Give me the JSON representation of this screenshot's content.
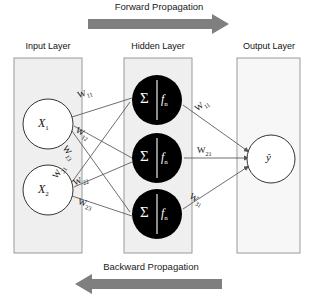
{
  "diagram": {
    "title_top": "Forward Propagation",
    "title_bottom": "Backward Propagation",
    "arrow_color": "#7f7f7f",
    "panel_color": "#efefef",
    "panel_border": "#9a9a9a",
    "node_stroke": "#333333",
    "hidden_node_fill": "#000000",
    "edge_color": "#555555"
  },
  "layers": {
    "input": {
      "label": "Input Layer"
    },
    "hidden": {
      "label": "Hidden Layer"
    },
    "output": {
      "label": "Output Layer"
    }
  },
  "nodes": {
    "input": [
      {
        "id": "x1",
        "label": "X",
        "sub": "1"
      },
      {
        "id": "x2",
        "label": "X",
        "sub": "2"
      }
    ],
    "hidden": [
      {
        "id": "h1",
        "sum_symbol": "Σ",
        "activation": "f",
        "activation_sub": "n"
      },
      {
        "id": "h2",
        "sum_symbol": "Σ",
        "activation": "f",
        "activation_sub": "n"
      },
      {
        "id": "h3",
        "sum_symbol": "Σ",
        "activation": "f",
        "activation_sub": "n"
      }
    ],
    "output": [
      {
        "id": "yhat",
        "label": "ŷ"
      }
    ]
  },
  "weights": {
    "input_to_hidden": [
      {
        "id": "w11",
        "label": "W",
        "sub": "11"
      },
      {
        "id": "w12",
        "label": "W",
        "sub": "12"
      },
      {
        "id": "w13",
        "label": "W",
        "sub": "13"
      },
      {
        "id": "w21",
        "label": "W",
        "sub": "21"
      },
      {
        "id": "w22",
        "label": "W",
        "sub": "22"
      },
      {
        "id": "w23",
        "label": "W",
        "sub": "23"
      }
    ],
    "hidden_to_output": [
      {
        "id": "h_w11",
        "label": "W",
        "sub": "11"
      },
      {
        "id": "h_w21",
        "label": "W",
        "sub": "21"
      },
      {
        "id": "h_w31",
        "label": "W",
        "sub": "31"
      }
    ]
  }
}
